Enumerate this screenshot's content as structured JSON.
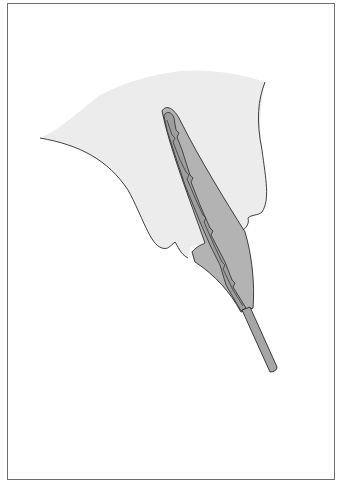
{
  "figure": {
    "parts": [
      {
        "name": "tissue-flap",
        "color": "#ececec"
      },
      {
        "name": "instrument-sheath",
        "color": "#b3b3b3"
      },
      {
        "name": "instrument-core",
        "color": "#9e9e9e"
      },
      {
        "name": "instrument-shaft",
        "color": "#a6a6a6"
      }
    ],
    "outline_color": "#2b2b2b",
    "frame_color": "#6e6e6e"
  }
}
